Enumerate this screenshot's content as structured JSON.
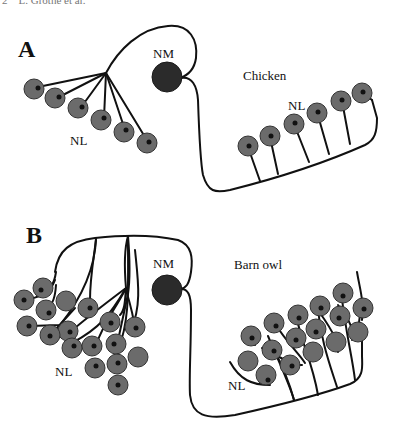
{
  "header": {
    "text": "2    L. Grothe et al."
  },
  "panels": [
    {
      "letter": "A",
      "species": "Chicken",
      "nucleus_magnocellularis_label": "NM",
      "nucleus_laminaris_left_label": "NL",
      "nucleus_laminaris_right_label": "NL"
    },
    {
      "letter": "B",
      "species": "Barn owl",
      "nucleus_magnocellularis_label": "NM",
      "nucleus_laminaris_left_label": "NL",
      "nucleus_laminaris_right_label": "NL"
    }
  ],
  "colors": {
    "nl_cell": "#6b6b6b",
    "nm_cell": "#2b2b2b",
    "axon": "#111111",
    "background": "#ffffff"
  }
}
